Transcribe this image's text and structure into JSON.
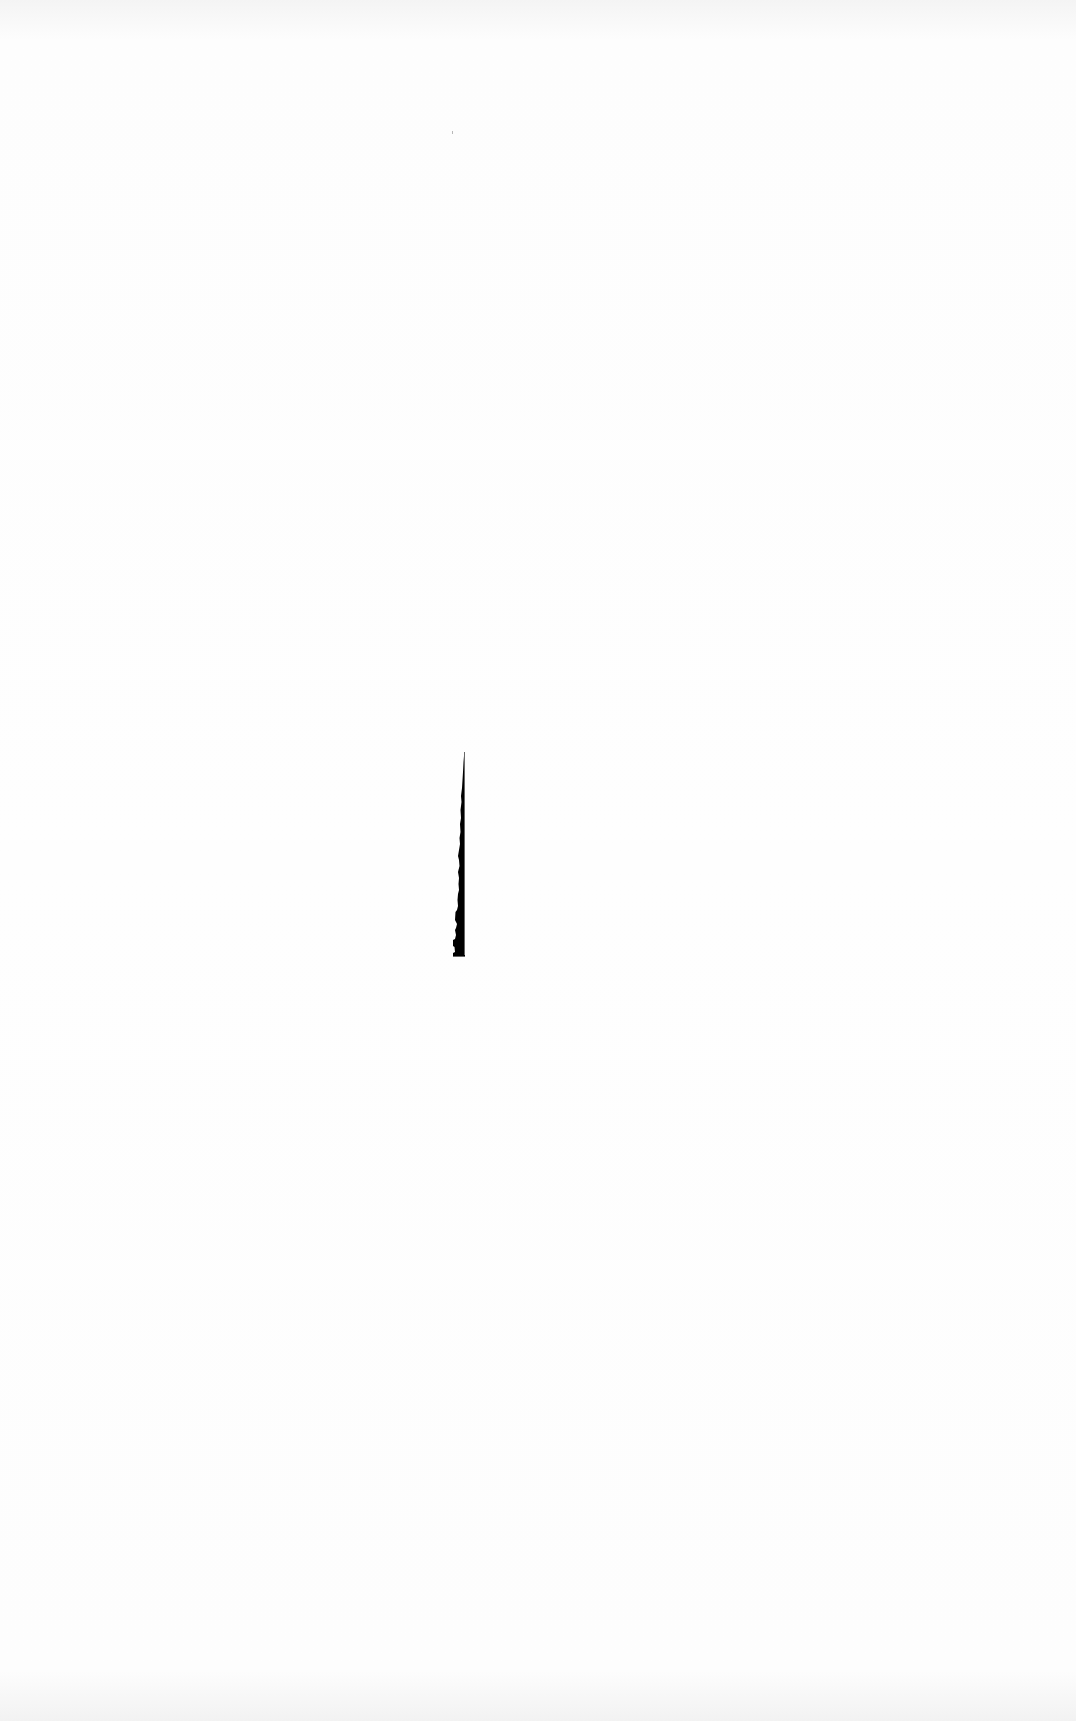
{
  "page": {
    "background": "#fdfdfd",
    "ink_color": "#000000",
    "speck_color": "#b8b8b8"
  },
  "shape": {
    "description": "narrow black vertical silhouette tapering to a point at top",
    "bbox": {
      "x": 450,
      "y": 752,
      "width": 20,
      "height": 208
    }
  }
}
